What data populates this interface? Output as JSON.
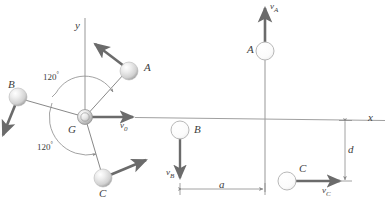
{
  "figure": {
    "colors": {
      "line": "#7a7a7a",
      "arrow": "#6b6b6b",
      "text": "#3d3d3d",
      "sphere_light": "#f2f2f2",
      "sphere_mid": "#d6d6d6",
      "sphere_dark": "#9a9a9a",
      "background": "#ffffff"
    }
  },
  "left_diagram": {
    "axis_y_label": "y",
    "center_label": "G",
    "center_velocity_label": "v",
    "center_velocity_sub": "0",
    "angle_upper": "120",
    "angle_upper_unit": "°",
    "angle_lower": "120",
    "angle_lower_unit": "°",
    "particles": [
      {
        "name": "A",
        "label": "A"
      },
      {
        "name": "B",
        "label": "B"
      },
      {
        "name": "C",
        "label": "C"
      }
    ]
  },
  "right_diagram": {
    "axis_x_label": "x",
    "particles": [
      {
        "name": "A",
        "label": "A",
        "velocity": "v",
        "velocity_sub": "A"
      },
      {
        "name": "B",
        "label": "B",
        "velocity": "v",
        "velocity_sub": "B"
      },
      {
        "name": "C",
        "label": "C",
        "velocity": "v",
        "velocity_sub": "C"
      }
    ],
    "dimensions": [
      {
        "name": "horizontal-distance",
        "label": "a"
      },
      {
        "name": "vertical-distance",
        "label": "d"
      }
    ]
  }
}
